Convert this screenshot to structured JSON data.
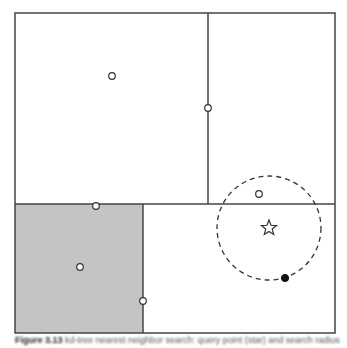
{
  "diagram": {
    "type": "kd-tree nearest neighbor search",
    "outer_box": {
      "x": 15,
      "y": 13,
      "w": 320,
      "h": 320
    },
    "lines": [
      {
        "name": "horizontal-split",
        "x1": 15,
        "y1": 204,
        "x2": 335,
        "y2": 204
      },
      {
        "name": "vertical-split-top",
        "x1": 208,
        "y1": 13,
        "x2": 208,
        "y2": 204
      },
      {
        "name": "vertical-split-bottom",
        "x1": 143,
        "y1": 204,
        "x2": 143,
        "y2": 333
      }
    ],
    "shaded_region": {
      "x": 15,
      "y": 204,
      "w": 128,
      "h": 129,
      "color": "#c4c4c4"
    },
    "open_points": [
      {
        "x": 112,
        "y": 76
      },
      {
        "x": 208,
        "y": 108
      },
      {
        "x": 96,
        "y": 206
      },
      {
        "x": 80,
        "y": 267
      },
      {
        "x": 143,
        "y": 301
      },
      {
        "x": 259,
        "y": 194
      }
    ],
    "filled_points": [
      {
        "x": 285,
        "y": 278
      }
    ],
    "query_star": {
      "x": 269,
      "y": 228
    },
    "search_circle": {
      "cx": 269,
      "cy": 228,
      "r": 52,
      "style": "dashed"
    }
  },
  "caption": {
    "label": "Figure 3.13",
    "text": "kd-tree nearest neighbor search: query point (star) and search radius"
  }
}
